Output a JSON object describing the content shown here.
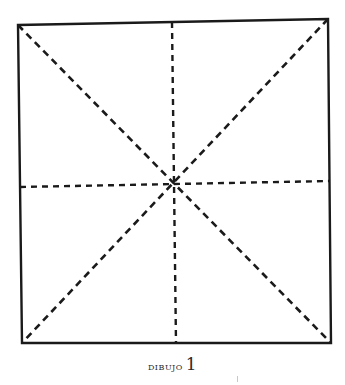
{
  "figure": {
    "caption_word": "DIBUJO",
    "caption_number": "1",
    "stroke_color": "#1a1a1a",
    "background_color": "#ffffff",
    "square": {
      "top_left": [
        18,
        25
      ],
      "top_right": [
        328,
        19
      ],
      "bottom_right": [
        331,
        343
      ],
      "bottom_left": [
        22,
        343
      ]
    },
    "center": [
      173,
      183
    ],
    "midpoints": {
      "top": [
        172,
        22
      ],
      "bottom": [
        176,
        343
      ],
      "left": [
        20,
        187
      ],
      "right": [
        330,
        181
      ]
    },
    "lines": [
      {
        "name": "diagonal-top-left-to-bottom-right",
        "style": "dashed"
      },
      {
        "name": "diagonal-top-right-to-bottom-left",
        "style": "dashed"
      },
      {
        "name": "vertical-midline",
        "style": "dashed"
      },
      {
        "name": "horizontal-midline",
        "style": "dashed"
      }
    ]
  }
}
